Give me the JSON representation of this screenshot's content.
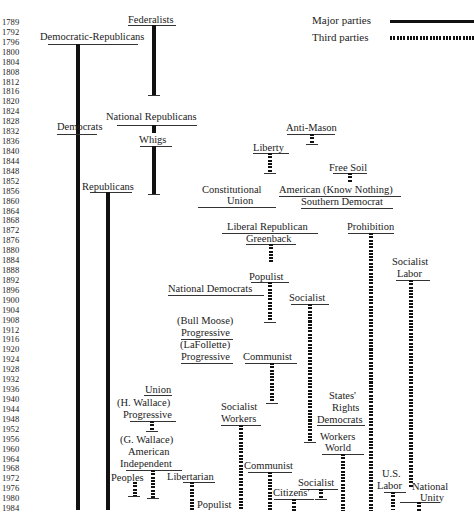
{
  "legend": {
    "major_label": "Major parties",
    "third_label": "Third parties"
  },
  "years": [
    "1789",
    "1792",
    "1796",
    "1800",
    "1804",
    "1808",
    "1812",
    "1816",
    "1820",
    "1824",
    "1828",
    "1832",
    "1836",
    "1840",
    "1844",
    "1848",
    "1852",
    "1856",
    "1860",
    "1864",
    "1868",
    "1872",
    "1876",
    "1880",
    "1884",
    "1888",
    "1892",
    "1896",
    "1900",
    "1904",
    "1908",
    "1912",
    "1916",
    "1920",
    "1924",
    "1928",
    "1932",
    "1936",
    "1940",
    "1944",
    "1948",
    "1952",
    "1956",
    "1960",
    "1964",
    "1968",
    "1972",
    "1976",
    "1980",
    "1984"
  ],
  "labels": {
    "federalists": "Federalists",
    "democratic_republicans": "Democratic-Republicans",
    "national_republicans": "National Republicans",
    "democrats": "Democrats",
    "whigs": "Whigs",
    "anti_mason": "Anti-Mason",
    "liberty": "Liberty",
    "free_soil": "Free Soil",
    "republicans": "Republicans",
    "constitutional_union_1": "Constitutional",
    "constitutional_union_2": "Union",
    "american_know_nothing": "American (Know Nothing)",
    "southern_democrat": "Southern Democrat",
    "liberal_republican": "Liberal Republican",
    "greenback": "Greenback",
    "prohibition": "Prohibition",
    "socialist_labor_1": "Socialist",
    "socialist_labor_2": "Labor",
    "populist": "Populist",
    "national_democrats": "National Democrats",
    "socialist": "Socialist",
    "bull_moose_1": "(Bull Moose)",
    "bull_moose_2": "Progressive",
    "lafollette_1": "(LaFollette)",
    "lafollette_2": "Progressive",
    "communist": "Communist",
    "union": "Union",
    "h_wallace_1": "(H. Wallace)",
    "h_wallace_2": "Progressive",
    "socialist_workers_1": "Socialist",
    "socialist_workers_2": "Workers",
    "states_rights_1": "States'",
    "states_rights_2": "Rights",
    "states_rights_3": "Democrats",
    "g_wallace_1": "(G. Wallace)",
    "g_wallace_2": "American",
    "g_wallace_3": "Independent",
    "workers_world_1": "Workers",
    "workers_world_2": "World",
    "peoples": "Peoples",
    "libertarian": "Libertarian",
    "communist_2": "Communist",
    "us_labor_1": "U.S.",
    "us_labor_2": "Labor",
    "national_unity_1": "National",
    "national_unity_2": "Unity",
    "socialist_2": "Socialist",
    "citizens": "Citizens'",
    "populist_2": "Populist"
  },
  "chart_data": {
    "type": "timeline",
    "title": "",
    "axis": {
      "orientation": "vertical",
      "label": "Election year",
      "start": 1789,
      "end": 1984
    },
    "legend": [
      {
        "name": "Major parties",
        "style": "solid thick line"
      },
      {
        "name": "Third parties",
        "style": "dotted thick line"
      }
    ],
    "series": [
      {
        "name": "Federalists",
        "type": "major",
        "start": 1789,
        "end": 1816
      },
      {
        "name": "Democratic-Republicans",
        "type": "major",
        "start": 1796,
        "end": 1828,
        "continues_as": "Democrats"
      },
      {
        "name": "Democrats",
        "type": "major",
        "start": 1828,
        "end": 1984
      },
      {
        "name": "National Republicans",
        "type": "major",
        "start": 1828,
        "end": 1832,
        "continues_as": "Whigs"
      },
      {
        "name": "Whigs",
        "type": "major",
        "start": 1836,
        "end": 1852
      },
      {
        "name": "Republicans",
        "type": "major",
        "start": 1856,
        "end": 1984
      },
      {
        "name": "Anti-Mason",
        "type": "third",
        "start": 1832,
        "end": 1832
      },
      {
        "name": "Liberty",
        "type": "third",
        "start": 1840,
        "end": 1844
      },
      {
        "name": "Free Soil",
        "type": "third",
        "start": 1848,
        "end": 1852
      },
      {
        "name": "Constitutional Union",
        "type": "third",
        "start": 1860,
        "end": 1860
      },
      {
        "name": "American (Know Nothing)",
        "type": "third",
        "start": 1856,
        "end": 1856
      },
      {
        "name": "Southern Democrat",
        "type": "third",
        "start": 1860,
        "end": 1860
      },
      {
        "name": "Liberal Republican",
        "type": "third",
        "start": 1872,
        "end": 1872
      },
      {
        "name": "Greenback",
        "type": "third",
        "start": 1876,
        "end": 1884
      },
      {
        "name": "Prohibition",
        "type": "third",
        "start": 1872,
        "end": 1984
      },
      {
        "name": "Socialist Labor",
        "type": "third",
        "start": 1892,
        "end": 1976
      },
      {
        "name": "Populist",
        "type": "third",
        "start": 1892,
        "end": 1908
      },
      {
        "name": "National Democrats",
        "type": "third",
        "start": 1896,
        "end": 1896
      },
      {
        "name": "Socialist",
        "type": "third",
        "start": 1900,
        "end": 1956
      },
      {
        "name": "(Bull Moose) Progressive",
        "type": "third",
        "start": 1912,
        "end": 1912
      },
      {
        "name": "(LaFollette) Progressive",
        "type": "third",
        "start": 1924,
        "end": 1924
      },
      {
        "name": "Communist",
        "type": "third",
        "start": 1924,
        "end": 1940
      },
      {
        "name": "Union",
        "type": "third",
        "start": 1936,
        "end": 1936
      },
      {
        "name": "(H. Wallace) Progressive",
        "type": "third",
        "start": 1948,
        "end": 1952
      },
      {
        "name": "Socialist Workers",
        "type": "third",
        "start": 1948,
        "end": 1984
      },
      {
        "name": "States' Rights Democrats",
        "type": "third",
        "start": 1948,
        "end": 1948
      },
      {
        "name": "Workers World",
        "type": "third",
        "start": 1960,
        "end": 1984
      },
      {
        "name": "(G. Wallace) American Independent",
        "type": "third",
        "start": 1968,
        "end": 1980
      },
      {
        "name": "Peoples",
        "type": "third",
        "start": 1972,
        "end": 1976
      },
      {
        "name": "Libertarian",
        "type": "third",
        "start": 1972,
        "end": 1984
      },
      {
        "name": "Communist",
        "type": "third",
        "start": 1968,
        "end": 1984
      },
      {
        "name": "U.S. Labor",
        "type": "third",
        "start": 1976,
        "end": 1984
      },
      {
        "name": "National Unity",
        "type": "third",
        "start": 1980,
        "end": 1984
      },
      {
        "name": "Socialist",
        "type": "third",
        "start": 1976,
        "end": 1980
      },
      {
        "name": "Citizens'",
        "type": "third",
        "start": 1980,
        "end": 1984
      },
      {
        "name": "Populist",
        "type": "third",
        "start": 1984,
        "end": 1984
      }
    ]
  }
}
